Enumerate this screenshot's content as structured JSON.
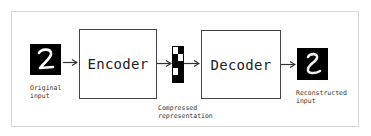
{
  "diagram": {
    "input": {
      "label_line1": "Original",
      "label_line2": "input",
      "digit": "2"
    },
    "encoder": {
      "label": "Encoder"
    },
    "code": {
      "label_line1": "Compressed",
      "label_line2": "representation",
      "grid": [
        [
          "w",
          "b"
        ],
        [
          "b",
          "w"
        ],
        [
          "b",
          "b"
        ],
        [
          "w",
          "b"
        ],
        [
          "b",
          "b"
        ]
      ]
    },
    "decoder": {
      "label": "Decoder"
    },
    "output": {
      "label_line1": "Reconstructed",
      "label_line2": "input",
      "digit": "2"
    },
    "colors": {
      "border": "#444444",
      "frame": "#d8d8d8",
      "digit_bg": "#000000",
      "digit_fg": "#ffffff"
    }
  }
}
